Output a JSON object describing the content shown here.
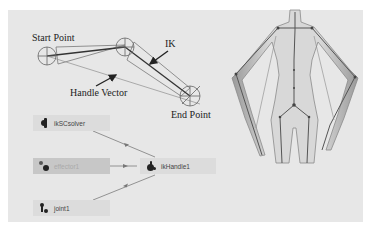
{
  "diagram": {
    "labels": {
      "start_point": "Start Point",
      "ik": "IK",
      "handle_vector": "Handle Vector",
      "end_point": "End Point"
    },
    "nodes": [
      {
        "id": "solver",
        "label": "ikSCsolver",
        "icon": "solver-icon"
      },
      {
        "id": "effector",
        "label": "effector1",
        "icon": "effector-icon"
      },
      {
        "id": "handle",
        "label": "ikHandle1",
        "icon": "ik-handle-icon"
      },
      {
        "id": "joint",
        "label": "joint1",
        "icon": "joint-icon"
      }
    ],
    "colors": {
      "panel": "#e7e7e7",
      "node": "#dcdcdc",
      "node_faded": "#c7c7c7",
      "line": "#555555"
    }
  }
}
